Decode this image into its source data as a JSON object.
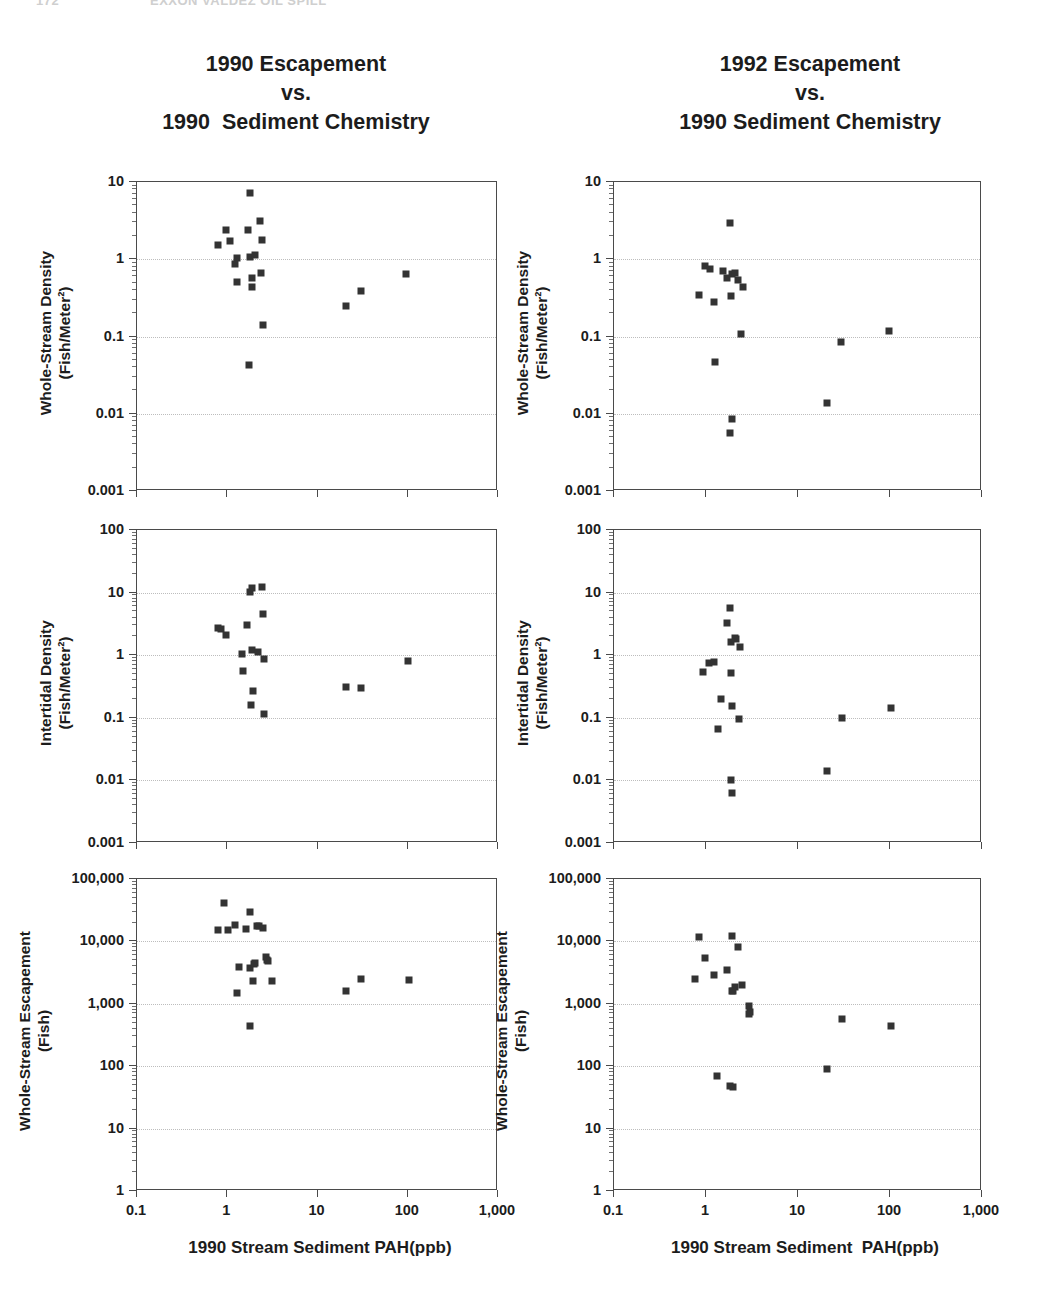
{
  "running_head": {
    "page_number": "172",
    "text": "EXXON VALDEZ OIL SPILL"
  },
  "titles": {
    "left": "1990 Escapement\nvs.\n1990  Sediment Chemistry",
    "right": "1992 Escapement\nvs.\n1990 Sediment Chemistry"
  },
  "axis_titles": {
    "x_left": "1990 Stream Sediment PAH(ppb)",
    "x_right": "1990 Stream Sediment  PAH(ppb)",
    "y_density": "Whole-Stream Density",
    "y_density_units": "(Fish/Meter²)",
    "y_intertidal": "Intertidal Density",
    "y_intertidal_units": "(Fish/Meter²)",
    "y_escapement": "Whole-Stream Escapement",
    "y_escapement_units": "(Fish)"
  },
  "x_ticks": [
    "0.1",
    "1",
    "10",
    "100",
    "1,000"
  ],
  "y_ticks_density": [
    "10",
    "1",
    "0.1",
    "0.01",
    "0.001"
  ],
  "y_ticks_intertidal": [
    "100",
    "10",
    "1",
    "0.1",
    "0.01",
    "0.001"
  ],
  "y_ticks_escapement": [
    "100,000",
    "10,000",
    "1,000",
    "100",
    "10",
    "1"
  ],
  "colors": {
    "marker": "#333333",
    "frame": "#4a4a4a",
    "grid": "#bdbdbd",
    "text": "#1c1c1c"
  },
  "chart_data": [
    {
      "id": "panel-1",
      "type": "scatter",
      "title": "1990 Escapement vs. 1990 Sediment Chemistry",
      "xlabel": "1990 Stream Sediment PAH(ppb)",
      "ylabel": "Whole-Stream Density (Fish/Meter²)",
      "xscale": "log",
      "yscale": "log",
      "xlim": [
        0.1,
        1000
      ],
      "ylim": [
        0.001,
        10
      ],
      "grid": true,
      "legend": null,
      "points": [
        {
          "x": 1.85,
          "y": 7.0
        },
        {
          "x": 2.35,
          "y": 3.0
        },
        {
          "x": 1.0,
          "y": 2.3
        },
        {
          "x": 1.75,
          "y": 2.3
        },
        {
          "x": 2.5,
          "y": 1.7
        },
        {
          "x": 0.82,
          "y": 1.5
        },
        {
          "x": 1.1,
          "y": 1.65
        },
        {
          "x": 1.3,
          "y": 1.0
        },
        {
          "x": 1.85,
          "y": 1.05
        },
        {
          "x": 2.1,
          "y": 1.1
        },
        {
          "x": 1.25,
          "y": 0.85
        },
        {
          "x": 2.45,
          "y": 0.65
        },
        {
          "x": 1.3,
          "y": 0.5
        },
        {
          "x": 1.95,
          "y": 0.55
        },
        {
          "x": 1.95,
          "y": 0.42
        },
        {
          "x": 98.0,
          "y": 0.62
        },
        {
          "x": 31.0,
          "y": 0.38
        },
        {
          "x": 21.0,
          "y": 0.24
        },
        {
          "x": 2.55,
          "y": 0.135
        },
        {
          "x": 1.8,
          "y": 0.041
        }
      ]
    },
    {
      "id": "panel-2",
      "type": "scatter",
      "title": "1992 Escapement vs. 1990 Sediment Chemistry",
      "xlabel": "1990 Stream Sediment  PAH(ppb)",
      "ylabel": "Whole-Stream Density (Fish/Meter²)",
      "xscale": "log",
      "yscale": "log",
      "xlim": [
        0.1,
        1000
      ],
      "ylim": [
        0.001,
        10
      ],
      "grid": true,
      "legend": null,
      "points": [
        {
          "x": 1.85,
          "y": 2.9
        },
        {
          "x": 1.0,
          "y": 0.8
        },
        {
          "x": 1.12,
          "y": 0.72
        },
        {
          "x": 1.55,
          "y": 0.68
        },
        {
          "x": 1.95,
          "y": 0.63
        },
        {
          "x": 2.1,
          "y": 0.65
        },
        {
          "x": 1.75,
          "y": 0.55
        },
        {
          "x": 2.3,
          "y": 0.52
        },
        {
          "x": 2.6,
          "y": 0.42
        },
        {
          "x": 0.85,
          "y": 0.33
        },
        {
          "x": 1.9,
          "y": 0.32
        },
        {
          "x": 1.25,
          "y": 0.27
        },
        {
          "x": 2.45,
          "y": 0.105
        },
        {
          "x": 100.0,
          "y": 0.115
        },
        {
          "x": 30.0,
          "y": 0.083
        },
        {
          "x": 1.3,
          "y": 0.046
        },
        {
          "x": 21.0,
          "y": 0.0135
        },
        {
          "x": 1.95,
          "y": 0.0082
        },
        {
          "x": 1.85,
          "y": 0.0055
        }
      ]
    },
    {
      "id": "panel-3",
      "type": "scatter",
      "title": "1990 Escapement vs. 1990 Sediment Chemistry",
      "xlabel": "1990 Stream Sediment PAH(ppb)",
      "ylabel": "Intertidal Density (Fish/Meter²)",
      "xscale": "log",
      "yscale": "log",
      "xlim": [
        0.1,
        1000
      ],
      "ylim": [
        0.001,
        100
      ],
      "grid": true,
      "legend": null,
      "points": [
        {
          "x": 1.85,
          "y": 10.0
        },
        {
          "x": 1.95,
          "y": 11.5
        },
        {
          "x": 2.5,
          "y": 12.0
        },
        {
          "x": 2.55,
          "y": 4.4
        },
        {
          "x": 0.8,
          "y": 2.6
        },
        {
          "x": 0.88,
          "y": 2.5
        },
        {
          "x": 1.7,
          "y": 2.9
        },
        {
          "x": 1.0,
          "y": 2.0
        },
        {
          "x": 1.95,
          "y": 1.15
        },
        {
          "x": 2.25,
          "y": 1.08
        },
        {
          "x": 1.5,
          "y": 1.0
        },
        {
          "x": 2.6,
          "y": 0.83
        },
        {
          "x": 103.0,
          "y": 0.78
        },
        {
          "x": 1.55,
          "y": 0.53
        },
        {
          "x": 21.0,
          "y": 0.3
        },
        {
          "x": 31.0,
          "y": 0.29
        },
        {
          "x": 2.0,
          "y": 0.26
        },
        {
          "x": 1.9,
          "y": 0.155
        },
        {
          "x": 2.65,
          "y": 0.112
        }
      ]
    },
    {
      "id": "panel-4",
      "type": "scatter",
      "title": "1992 Escapement vs. 1990 Sediment Chemistry",
      "xlabel": "1990 Stream Sediment  PAH(ppb)",
      "ylabel": "Intertidal Density (Fish/Meter²)",
      "xscale": "log",
      "yscale": "log",
      "xlim": [
        0.1,
        1000
      ],
      "ylim": [
        0.001,
        100
      ],
      "grid": true,
      "legend": null,
      "points": [
        {
          "x": 1.85,
          "y": 5.5
        },
        {
          "x": 1.72,
          "y": 3.1
        },
        {
          "x": 2.1,
          "y": 1.8
        },
        {
          "x": 2.15,
          "y": 1.75
        },
        {
          "x": 1.9,
          "y": 1.55
        },
        {
          "x": 2.4,
          "y": 1.3
        },
        {
          "x": 1.1,
          "y": 0.72
        },
        {
          "x": 1.25,
          "y": 0.75
        },
        {
          "x": 0.95,
          "y": 0.52
        },
        {
          "x": 1.9,
          "y": 0.51
        },
        {
          "x": 1.5,
          "y": 0.19
        },
        {
          "x": 1.95,
          "y": 0.15
        },
        {
          "x": 105.0,
          "y": 0.14
        },
        {
          "x": 2.35,
          "y": 0.092
        },
        {
          "x": 31.0,
          "y": 0.095
        },
        {
          "x": 1.4,
          "y": 0.065
        },
        {
          "x": 21.0,
          "y": 0.0138
        },
        {
          "x": 1.9,
          "y": 0.0099
        },
        {
          "x": 1.95,
          "y": 0.006
        }
      ]
    },
    {
      "id": "panel-5",
      "type": "scatter",
      "title": "1990 Escapement vs. 1990 Sediment Chemistry",
      "xlabel": "1990 Stream Sediment PAH(ppb)",
      "ylabel": "Whole-Stream Escapement (Fish)",
      "xscale": "log",
      "yscale": "log",
      "xlim": [
        0.1,
        1000
      ],
      "ylim": [
        1,
        100000
      ],
      "grid": true,
      "legend": null,
      "points": [
        {
          "x": 0.95,
          "y": 40000
        },
        {
          "x": 1.85,
          "y": 28000
        },
        {
          "x": 1.25,
          "y": 17500
        },
        {
          "x": 2.2,
          "y": 17000
        },
        {
          "x": 2.3,
          "y": 17000
        },
        {
          "x": 2.55,
          "y": 16000
        },
        {
          "x": 0.8,
          "y": 14500
        },
        {
          "x": 1.05,
          "y": 14800
        },
        {
          "x": 1.65,
          "y": 15000
        },
        {
          "x": 2.75,
          "y": 5400
        },
        {
          "x": 2.8,
          "y": 4800
        },
        {
          "x": 2.9,
          "y": 4600
        },
        {
          "x": 1.4,
          "y": 3700
        },
        {
          "x": 1.85,
          "y": 3600
        },
        {
          "x": 2.05,
          "y": 4200
        },
        {
          "x": 2.1,
          "y": 4300
        },
        {
          "x": 31.0,
          "y": 2400
        },
        {
          "x": 105.0,
          "y": 2300
        },
        {
          "x": 2.0,
          "y": 2200
        },
        {
          "x": 3.2,
          "y": 2250
        },
        {
          "x": 21.0,
          "y": 1550
        },
        {
          "x": 1.3,
          "y": 1450
        },
        {
          "x": 1.85,
          "y": 420
        }
      ]
    },
    {
      "id": "panel-6",
      "type": "scatter",
      "title": "1992 Escapement vs. 1990 Sediment Chemistry",
      "xlabel": "1990 Stream Sediment  PAH(ppb)",
      "ylabel": "Whole-Stream Escapement (Fish)",
      "xscale": "log",
      "yscale": "log",
      "xlim": [
        0.1,
        1000
      ],
      "ylim": [
        1,
        100000
      ],
      "grid": true,
      "legend": null,
      "points": [
        {
          "x": 1.95,
          "y": 11800
        },
        {
          "x": 0.85,
          "y": 11200
        },
        {
          "x": 2.3,
          "y": 7800
        },
        {
          "x": 1.0,
          "y": 5200
        },
        {
          "x": 1.75,
          "y": 3300
        },
        {
          "x": 1.25,
          "y": 2750
        },
        {
          "x": 0.78,
          "y": 2450
        },
        {
          "x": 2.5,
          "y": 1950
        },
        {
          "x": 2.1,
          "y": 1800
        },
        {
          "x": 1.95,
          "y": 1550
        },
        {
          "x": 2.0,
          "y": 1520
        },
        {
          "x": 3.0,
          "y": 880
        },
        {
          "x": 3.05,
          "y": 700
        },
        {
          "x": 3.0,
          "y": 660
        },
        {
          "x": 31.0,
          "y": 540
        },
        {
          "x": 105.0,
          "y": 420
        },
        {
          "x": 21.0,
          "y": 88
        },
        {
          "x": 1.35,
          "y": 66
        },
        {
          "x": 1.85,
          "y": 46
        },
        {
          "x": 2.0,
          "y": 44
        }
      ]
    }
  ]
}
